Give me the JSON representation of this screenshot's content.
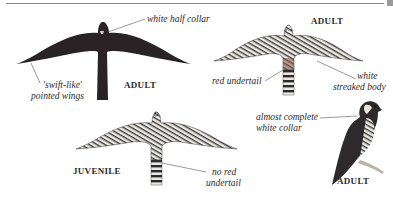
{
  "illustration": {
    "subject": "falcon identification plate",
    "figures": [
      {
        "id": "adult-dark-flight",
        "age_label": "ADULT",
        "annotations": [
          "white half collar",
          "'swift-like'",
          "pointed wings"
        ]
      },
      {
        "id": "adult-underside-flight",
        "age_label": "ADULT",
        "annotations": [
          "red undertail",
          "white",
          "streaked body"
        ]
      },
      {
        "id": "juvenile-underside-flight",
        "age_label": "JUVENILE",
        "annotations": [
          "no red",
          "undertail"
        ]
      },
      {
        "id": "adult-perched",
        "age_label": "ADULT",
        "annotations": [
          "almost complete",
          "white collar"
        ]
      }
    ]
  },
  "colors": {
    "dark_plumage": "#2b2426",
    "streak": "#3a3a3a",
    "pale": "#e8e4de",
    "undertail_red": "#8a5a4a",
    "leader_line": "#555555",
    "rule": "#8a8a8a"
  }
}
